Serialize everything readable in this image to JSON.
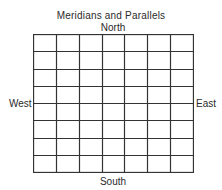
{
  "diagram": {
    "title": "Meridians and Parallels",
    "directions": {
      "north": "North",
      "south": "South",
      "west": "West",
      "east": "East"
    },
    "grid": {
      "columns": 7,
      "rows": 8,
      "line_color": "#333333",
      "background": "#ffffff"
    }
  }
}
